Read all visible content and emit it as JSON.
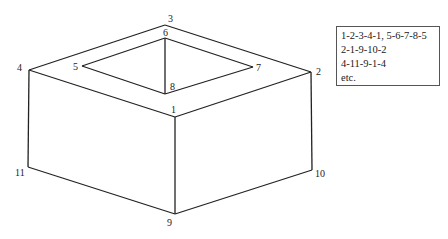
{
  "diagram": {
    "vertices": [
      {
        "id": "1",
        "x": 175,
        "y": 117,
        "lx": 171,
        "ly": 113
      },
      {
        "id": "2",
        "x": 311,
        "y": 72,
        "lx": 316,
        "ly": 75
      },
      {
        "id": "3",
        "x": 165,
        "y": 25,
        "lx": 168,
        "ly": 22
      },
      {
        "id": "4",
        "x": 29,
        "y": 70,
        "lx": 17,
        "ly": 71
      },
      {
        "id": "5",
        "x": 82,
        "y": 66,
        "lx": 73,
        "ly": 70
      },
      {
        "id": "6",
        "x": 165,
        "y": 38,
        "lx": 163,
        "ly": 36
      },
      {
        "id": "7",
        "x": 253,
        "y": 67,
        "lx": 256,
        "ly": 71
      },
      {
        "id": "8",
        "x": 165,
        "y": 94,
        "lx": 170,
        "ly": 90
      },
      {
        "id": "9",
        "x": 175,
        "y": 214,
        "lx": 167,
        "ly": 226
      },
      {
        "id": "10",
        "x": 312,
        "y": 170,
        "lx": 315,
        "ly": 177
      },
      {
        "id": "11",
        "x": 28,
        "y": 167,
        "lx": 15,
        "ly": 176
      }
    ],
    "edges": [
      [
        "1",
        "2"
      ],
      [
        "2",
        "3"
      ],
      [
        "3",
        "4"
      ],
      [
        "4",
        "1"
      ],
      [
        "5",
        "6"
      ],
      [
        "6",
        "7"
      ],
      [
        "7",
        "8"
      ],
      [
        "8",
        "5"
      ],
      [
        "6",
        "8"
      ],
      [
        "2",
        "10"
      ],
      [
        "10",
        "9"
      ],
      [
        "9",
        "1"
      ],
      [
        "4",
        "11"
      ],
      [
        "11",
        "9"
      ]
    ]
  },
  "legend": {
    "lines": [
      "1-2-3-4-1, 5-6-7-8-5",
      "2-1-9-10-2",
      "4-11-9-1-4",
      "etc."
    ]
  }
}
